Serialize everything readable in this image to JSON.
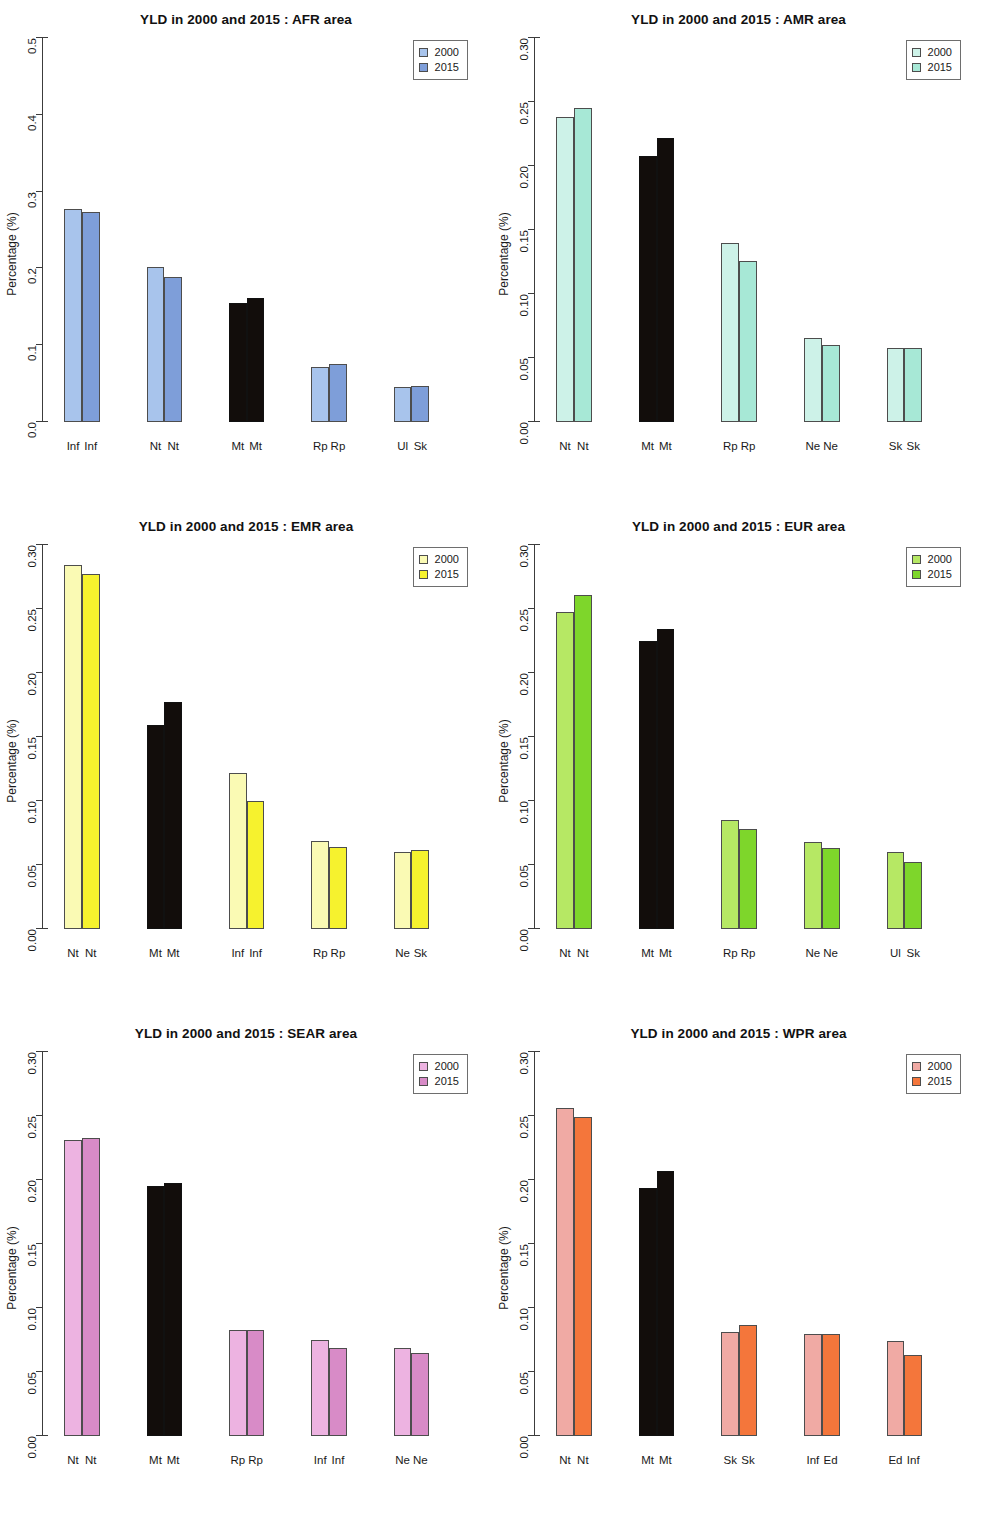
{
  "figure": {
    "title_prefix": "YLD in 2000 and 2015 :",
    "y_axis_title": "Percentage (%)",
    "legend_labels": [
      "2000",
      "2015"
    ]
  },
  "chart_data": [
    {
      "type": "bar",
      "title": "YLD in 2000 and 2015 : AFR area",
      "area": "AFR",
      "xlabel": "",
      "ylabel": "Percentage (%)",
      "ylim": [
        0,
        0.5
      ],
      "yticks": [
        0.0,
        0.1,
        0.2,
        0.3,
        0.4,
        0.5
      ],
      "ytick_labels": [
        "0.0",
        "0.1",
        "0.2",
        "0.3",
        "0.4",
        "0.5"
      ],
      "grid": false,
      "legend": [
        "2000",
        "2015"
      ],
      "legend_position": "top-right",
      "colors": {
        "y2000": "#A8C4EC",
        "y2015": "#7E9ED9",
        "highlight": "#120D0B"
      },
      "categories": [
        "Inf",
        "Nt",
        "Mt",
        "Rp",
        "Ul/Sk"
      ],
      "tick_labels": [
        [
          "Inf",
          "Inf"
        ],
        [
          "Nt",
          "Nt"
        ],
        [
          "Mt",
          "Mt"
        ],
        [
          "Rp",
          "Rp"
        ],
        [
          "Ul",
          "Sk"
        ]
      ],
      "highlight_group": "Mt",
      "series": [
        {
          "name": "2000",
          "values": [
            0.278,
            0.202,
            0.155,
            0.072,
            0.046
          ]
        },
        {
          "name": "2015",
          "values": [
            0.274,
            0.189,
            0.162,
            0.076,
            0.047
          ]
        }
      ]
    },
    {
      "type": "bar",
      "title": "YLD in 2000 and 2015 : AMR area",
      "area": "AMR",
      "xlabel": "",
      "ylabel": "Percentage (%)",
      "ylim": [
        0,
        0.3
      ],
      "yticks": [
        0.0,
        0.05,
        0.1,
        0.15,
        0.2,
        0.25,
        0.3
      ],
      "ytick_labels": [
        "0.00",
        "0.05",
        "0.10",
        "0.15",
        "0.20",
        "0.25",
        "0.30"
      ],
      "grid": false,
      "legend": [
        "2000",
        "2015"
      ],
      "legend_position": "top-right",
      "colors": {
        "y2000": "#CDF2E8",
        "y2015": "#A7E8D6",
        "highlight": "#120D0B"
      },
      "categories": [
        "Nt",
        "Mt",
        "Rp",
        "Ne",
        "Sk"
      ],
      "tick_labels": [
        [
          "Nt",
          "Nt"
        ],
        [
          "Mt",
          "Mt"
        ],
        [
          "Rp",
          "Rp"
        ],
        [
          "Ne",
          "Ne"
        ],
        [
          "Sk",
          "Sk"
        ]
      ],
      "highlight_group": "Mt",
      "series": [
        {
          "name": "2000",
          "values": [
            0.238,
            0.208,
            0.14,
            0.066,
            0.058
          ]
        },
        {
          "name": "2015",
          "values": [
            0.245,
            0.222,
            0.126,
            0.06,
            0.058
          ]
        }
      ]
    },
    {
      "type": "bar",
      "title": "YLD in 2000 and 2015 : EMR area",
      "area": "EMR",
      "xlabel": "",
      "ylabel": "Percentage (%)",
      "ylim": [
        0,
        0.3
      ],
      "yticks": [
        0.0,
        0.05,
        0.1,
        0.15,
        0.2,
        0.25,
        0.3
      ],
      "ytick_labels": [
        "0.00",
        "0.05",
        "0.10",
        "0.15",
        "0.20",
        "0.25",
        "0.30"
      ],
      "grid": false,
      "legend": [
        "2000",
        "2015"
      ],
      "legend_position": "top-right",
      "colors": {
        "y2000": "#FAFAB4",
        "y2015": "#F6F22E",
        "highlight": "#120D0B"
      },
      "categories": [
        "Nt",
        "Mt",
        "Inf",
        "Rp",
        "Ne/Sk"
      ],
      "tick_labels": [
        [
          "Nt",
          "Nt"
        ],
        [
          "Mt",
          "Mt"
        ],
        [
          "Inf",
          "Inf"
        ],
        [
          "Rp",
          "Rp"
        ],
        [
          "Ne",
          "Sk"
        ]
      ],
      "highlight_group": "Mt",
      "series": [
        {
          "name": "2000",
          "values": [
            0.284,
            0.159,
            0.122,
            0.069,
            0.06
          ]
        },
        {
          "name": "2015",
          "values": [
            0.277,
            0.177,
            0.1,
            0.064,
            0.062
          ]
        }
      ]
    },
    {
      "type": "bar",
      "title": "YLD in 2000 and 2015 : EUR area",
      "area": "EUR",
      "xlabel": "",
      "ylabel": "Percentage (%)",
      "ylim": [
        0,
        0.3
      ],
      "yticks": [
        0.0,
        0.05,
        0.1,
        0.15,
        0.2,
        0.25,
        0.3
      ],
      "ytick_labels": [
        "0.00",
        "0.05",
        "0.10",
        "0.15",
        "0.20",
        "0.25",
        "0.30"
      ],
      "grid": false,
      "legend": [
        "2000",
        "2015"
      ],
      "legend_position": "top-right",
      "colors": {
        "y2000": "#B6E864",
        "y2015": "#7ED62B",
        "highlight": "#120D0B"
      },
      "categories": [
        "Nt",
        "Mt",
        "Rp",
        "Ne",
        "Ul/Sk"
      ],
      "tick_labels": [
        [
          "Nt",
          "Nt"
        ],
        [
          "Mt",
          "Mt"
        ],
        [
          "Rp",
          "Rp"
        ],
        [
          "Ne",
          "Ne"
        ],
        [
          "Ul",
          "Sk"
        ]
      ],
      "highlight_group": "Mt",
      "series": [
        {
          "name": "2000",
          "values": [
            0.248,
            0.225,
            0.085,
            0.068,
            0.06
          ]
        },
        {
          "name": "2015",
          "values": [
            0.261,
            0.234,
            0.078,
            0.063,
            0.052
          ]
        }
      ]
    },
    {
      "type": "bar",
      "title": "YLD in 2000 and 2015 : SEAR area",
      "area": "SEAR",
      "xlabel": "",
      "ylabel": "Percentage (%)",
      "ylim": [
        0,
        0.3
      ],
      "yticks": [
        0.0,
        0.05,
        0.1,
        0.15,
        0.2,
        0.25,
        0.3
      ],
      "ytick_labels": [
        "0.00",
        "0.05",
        "0.10",
        "0.15",
        "0.20",
        "0.25",
        "0.30"
      ],
      "grid": false,
      "legend": [
        "2000",
        "2015"
      ],
      "legend_position": "top-right",
      "colors": {
        "y2000": "#EDB3E1",
        "y2015": "#D88BC7",
        "highlight": "#120D0B"
      },
      "categories": [
        "Nt",
        "Mt",
        "Rp",
        "Inf",
        "Ne"
      ],
      "tick_labels": [
        [
          "Nt",
          "Nt"
        ],
        [
          "Mt",
          "Mt"
        ],
        [
          "Rp",
          "Rp"
        ],
        [
          "Inf",
          "Inf"
        ],
        [
          "Ne",
          "Ne"
        ]
      ],
      "highlight_group": "Mt",
      "series": [
        {
          "name": "2000",
          "values": [
            0.231,
            0.195,
            0.083,
            0.075,
            0.069
          ]
        },
        {
          "name": "2015",
          "values": [
            0.233,
            0.198,
            0.083,
            0.069,
            0.065
          ]
        }
      ]
    },
    {
      "type": "bar",
      "title": "YLD in 2000 and 2015 : WPR area",
      "area": "WPR",
      "xlabel": "",
      "ylabel": "Percentage (%)",
      "ylim": [
        0,
        0.3
      ],
      "yticks": [
        0.0,
        0.05,
        0.1,
        0.15,
        0.2,
        0.25,
        0.3
      ],
      "ytick_labels": [
        "0.00",
        "0.05",
        "0.10",
        "0.15",
        "0.20",
        "0.25",
        "0.30"
      ],
      "grid": false,
      "legend": [
        "2000",
        "2015"
      ],
      "legend_position": "top-right",
      "colors": {
        "y2000": "#F0AAA4",
        "y2015": "#F4763B",
        "highlight": "#120D0B"
      },
      "categories": [
        "Nt",
        "Mt",
        "Sk",
        "Inf/Ed",
        "Ed/Inf"
      ],
      "tick_labels": [
        [
          "Nt",
          "Nt"
        ],
        [
          "Mt",
          "Mt"
        ],
        [
          "Sk",
          "Sk"
        ],
        [
          "Inf",
          "Ed"
        ],
        [
          "Ed",
          "Inf"
        ]
      ],
      "highlight_group": "Mt",
      "series": [
        {
          "name": "2000",
          "values": [
            0.256,
            0.194,
            0.081,
            0.08,
            0.074
          ]
        },
        {
          "name": "2015",
          "values": [
            0.249,
            0.207,
            0.087,
            0.08,
            0.063
          ]
        }
      ]
    }
  ]
}
